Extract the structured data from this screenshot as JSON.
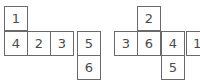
{
  "nets": [
    {
      "name": "left-net",
      "cells": [
        {
          "label": "1",
          "x": 4,
          "y": 6
        },
        {
          "label": "4",
          "x": 4,
          "y": 31
        },
        {
          "label": "2",
          "x": 28,
          "y": 31
        },
        {
          "label": "3",
          "x": 52,
          "y": 31
        },
        {
          "label": "5",
          "x": 76,
          "y": 31
        },
        {
          "label": "6",
          "x": 76,
          "y": 56
        }
      ]
    },
    {
      "name": "right-net",
      "cells": [
        {
          "label": "2",
          "x": 138,
          "y": 6
        },
        {
          "label": "3",
          "x": 114,
          "y": 31
        },
        {
          "label": "6",
          "x": 138,
          "y": 31
        },
        {
          "label": "4",
          "x": 162,
          "y": 31
        },
        {
          "label": "1",
          "x": 186,
          "y": 31
        },
        {
          "label": "5",
          "x": 162,
          "y": 56
        }
      ]
    }
  ],
  "colors": {
    "border": "#6a6a6a",
    "text": "#4a4a4a"
  }
}
